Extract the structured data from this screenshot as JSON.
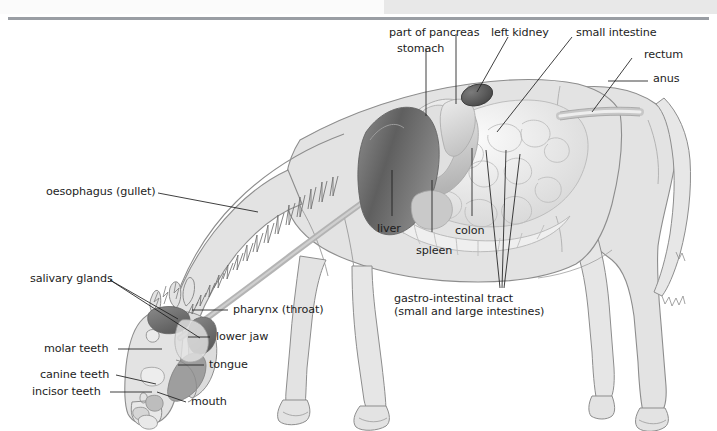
{
  "figure": {
    "background_color": "#ffffff",
    "body_fill": "#e3e3e3",
    "outline_color": "#8d8d8d",
    "leader_line_color": "#1d1d1d",
    "label_color": "#1d1d1d",
    "top_band": {
      "left_color": "#fbfbfb",
      "right_color": "#e8e8e8",
      "rule_color": "#9a9ea4"
    }
  },
  "labels": {
    "part_of_pancreas": "part of pancreas",
    "stomach": "stomach",
    "left_kidney": "left kidney",
    "small_intestine": "small intestine",
    "rectum": "rectum",
    "anus": "anus",
    "oesophagus": "oesophagus (gullet)",
    "salivary_glands": "salivary glands",
    "pharynx": "pharynx (throat)",
    "lower_jaw": "lower jaw",
    "molar_teeth": "molar teeth",
    "tongue": "tongue",
    "canine_teeth": "canine teeth",
    "incisor_teeth": "incisor teeth",
    "mouth": "mouth",
    "liver": "liver",
    "spleen": "spleen",
    "colon": "colon",
    "gastro_line1": "gastro-intestinal tract",
    "gastro_line2": "(small and large intestines)"
  },
  "organs": [
    {
      "name": "liver",
      "shade": "#6f6f6f"
    },
    {
      "name": "stomach",
      "shade": "#cfcfcf"
    },
    {
      "name": "part of pancreas",
      "shade": "#d6d6d6"
    },
    {
      "name": "left kidney",
      "shade": "#5a5a5a"
    },
    {
      "name": "small intestine",
      "shade": "#ededed"
    },
    {
      "name": "colon",
      "shade": "#e9e9e9"
    },
    {
      "name": "spleen",
      "shade": "#bdbdbd"
    },
    {
      "name": "rectum",
      "shade": "#dcdcdc"
    },
    {
      "name": "salivary glands",
      "shade": "#7a7a7a"
    },
    {
      "name": "tongue",
      "shade": "#9a9a9a"
    },
    {
      "name": "oesophagus",
      "shade": "#b9b9b9"
    }
  ]
}
